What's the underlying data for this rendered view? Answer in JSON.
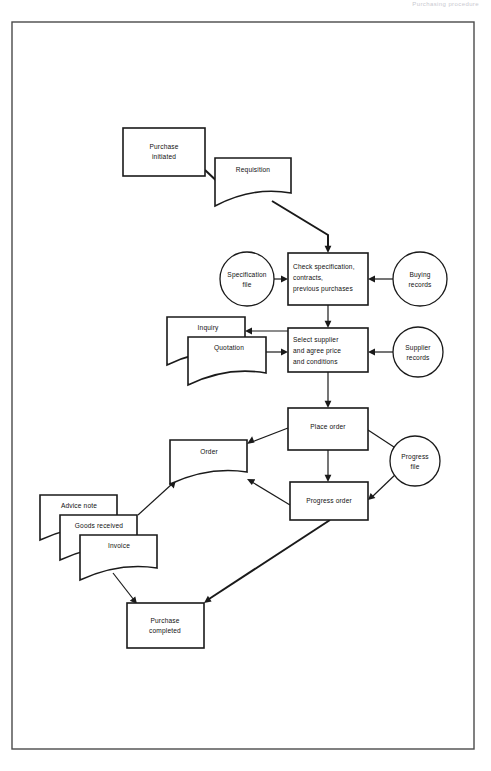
{
  "page": {
    "header_caption": "Purchasing procedure",
    "border": {
      "x": 12,
      "y": 22,
      "width": 462,
      "height": 727
    }
  },
  "diagram": {
    "type": "flowchart",
    "colors": {
      "stroke": "#1a1a1a",
      "fill": "#ffffff",
      "border": "#4a4a4a"
    },
    "nodes": [
      {
        "id": "purchase-initiated",
        "shape": "process",
        "label_lines": [
          "Purchase",
          "initiated"
        ],
        "x": 123,
        "y": 128,
        "width": 82,
        "height": 48
      },
      {
        "id": "requisition",
        "shape": "document",
        "label_lines": [
          "Requisition"
        ],
        "x": 215,
        "y": 158,
        "width": 76,
        "height": 48
      },
      {
        "id": "specification-file",
        "shape": "circle",
        "label_lines": [
          "Specification",
          "file"
        ],
        "cx": 247,
        "cy": 279,
        "r": 27
      },
      {
        "id": "check-specification",
        "shape": "process",
        "label_lines": [
          "Check specification,",
          "contracts,",
          "previous purchases"
        ],
        "x": 288,
        "y": 253,
        "width": 80,
        "height": 52
      },
      {
        "id": "buying-records",
        "shape": "circle",
        "label_lines": [
          "Buying",
          "records"
        ],
        "cx": 420,
        "cy": 279,
        "r": 27
      },
      {
        "id": "inquiry",
        "shape": "document",
        "label_lines": [
          "Inquiry"
        ],
        "x": 167,
        "y": 317,
        "width": 78,
        "height": 48
      },
      {
        "id": "quotation",
        "shape": "document",
        "label_lines": [
          "Quotation"
        ],
        "x": 188,
        "y": 337,
        "width": 78,
        "height": 48
      },
      {
        "id": "select-supplier",
        "shape": "process",
        "label_lines": [
          "Select supplier",
          "and agree price",
          "and conditions"
        ],
        "x": 288,
        "y": 328,
        "width": 80,
        "height": 44
      },
      {
        "id": "supplier-records",
        "shape": "circle",
        "label_lines": [
          "Supplier",
          "records"
        ],
        "cx": 418,
        "cy": 352,
        "r": 25
      },
      {
        "id": "place-order",
        "shape": "process",
        "label_lines": [
          "Place order"
        ],
        "x": 288,
        "y": 408,
        "width": 80,
        "height": 42
      },
      {
        "id": "order",
        "shape": "document",
        "label_lines": [
          "Order"
        ],
        "x": 170,
        "y": 440,
        "width": 77,
        "height": 44
      },
      {
        "id": "progress-file",
        "shape": "circle",
        "label_lines": [
          "Progress",
          "file"
        ],
        "cx": 415,
        "cy": 461,
        "r": 25
      },
      {
        "id": "progress-order",
        "shape": "process",
        "label_lines": [
          "Progress order"
        ],
        "x": 290,
        "y": 482,
        "width": 78,
        "height": 38
      },
      {
        "id": "advice-note",
        "shape": "document",
        "label_lines": [
          "Advice note"
        ],
        "x": 40,
        "y": 495,
        "width": 77,
        "height": 45
      },
      {
        "id": "goods-received",
        "shape": "document",
        "label_lines": [
          "Goods received"
        ],
        "x": 60,
        "y": 515,
        "width": 77,
        "height": 45
      },
      {
        "id": "invoice",
        "shape": "document",
        "label_lines": [
          "Invoice"
        ],
        "x": 80,
        "y": 535,
        "width": 77,
        "height": 45
      },
      {
        "id": "purchase-completed",
        "shape": "process",
        "label_lines": [
          "Purchase",
          "completed"
        ],
        "x": 127,
        "y": 603,
        "width": 77,
        "height": 45
      }
    ],
    "edges": [
      {
        "id": "purchase-initiated-to-requisition",
        "from": "purchase-initiated",
        "to": "requisition"
      },
      {
        "id": "requisition-to-check-specification",
        "from": "requisition",
        "to": "check-specification"
      },
      {
        "id": "specification-file-to-check",
        "from": "specification-file",
        "to": "check-specification"
      },
      {
        "id": "buying-records-to-check",
        "from": "buying-records",
        "to": "check-specification"
      },
      {
        "id": "check-to-select-supplier",
        "from": "check-specification",
        "to": "select-supplier"
      },
      {
        "id": "select-supplier-to-inquiry",
        "from": "select-supplier",
        "to": "inquiry"
      },
      {
        "id": "quotation-to-select-supplier",
        "from": "quotation",
        "to": "select-supplier"
      },
      {
        "id": "supplier-records-to-select",
        "from": "supplier-records",
        "to": "select-supplier"
      },
      {
        "id": "select-supplier-to-place-order",
        "from": "select-supplier",
        "to": "place-order"
      },
      {
        "id": "place-order-to-order",
        "from": "place-order",
        "to": "order"
      },
      {
        "id": "place-order-to-progress-file",
        "from": "place-order",
        "to": "progress-file"
      },
      {
        "id": "place-order-to-progress-order",
        "from": "place-order",
        "to": "progress-order"
      },
      {
        "id": "progress-file-to-progress-order",
        "from": "progress-file",
        "to": "progress-order"
      },
      {
        "id": "progress-order-to-order",
        "from": "progress-order",
        "to": "order"
      },
      {
        "id": "order-to-invoice-stack",
        "from": "order",
        "to": "invoice"
      },
      {
        "id": "invoice-to-purchase-completed",
        "from": "invoice",
        "to": "purchase-completed"
      },
      {
        "id": "progress-order-to-purchase-completed",
        "from": "progress-order",
        "to": "purchase-completed"
      }
    ]
  }
}
